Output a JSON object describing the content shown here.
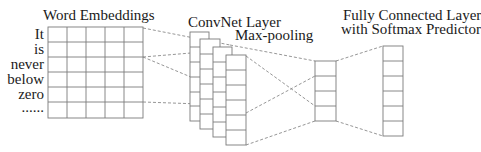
{
  "labels": {
    "word_embeddings": "Word Embeddings",
    "convnet_layer": "ConvNet Layer",
    "max_pooling": "Max-pooling",
    "fc_line1": "Fully Connected Layer",
    "fc_line2": "with Softmax Predictor"
  },
  "words": [
    "It",
    "is",
    "never",
    "below",
    "zero",
    "......"
  ],
  "embedding_grid": {
    "rows": 6,
    "cols": 5
  },
  "convnet": {
    "feature_maps": 4,
    "cells_per_map": 6
  },
  "maxpool": {
    "cells": 4
  },
  "fully_connected": {
    "cells": 6
  },
  "colors": {
    "line": "#7a7a7a",
    "dash": "#8a8a8a",
    "text": "#1a1a1a"
  }
}
